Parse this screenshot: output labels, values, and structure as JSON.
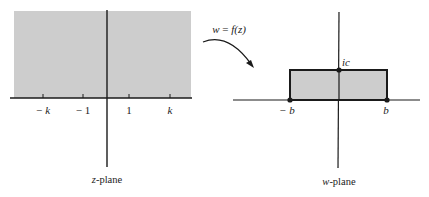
{
  "figure": {
    "colors": {
      "shade": "#cfcfcf",
      "line": "#1a1a1a",
      "background": "#ffffff"
    }
  },
  "z_plane": {
    "caption_var": "z",
    "caption_rest": "-plane",
    "shaded_region": "upper half-plane",
    "ticks": [
      {
        "label_sign": "−",
        "label_var": "k",
        "position": -2
      },
      {
        "label_sign": "−",
        "label_var": "1",
        "position": -1
      },
      {
        "label_sign": "",
        "label_var": "1",
        "position": 1
      },
      {
        "label_sign": "",
        "label_var": "k",
        "position": 2
      }
    ],
    "tick_labels": [
      "− k",
      "− 1",
      "1",
      "k"
    ]
  },
  "mapping": {
    "label_lhs": "w",
    "label_eq": " = ",
    "label_rhs": "f(z)",
    "full_label": "w = f(z)"
  },
  "w_plane": {
    "caption_var": "w",
    "caption_rest": "-plane",
    "shaded_region": "rectangle",
    "points": [
      {
        "label": "− b",
        "name": "minus-b"
      },
      {
        "label": "b",
        "name": "b"
      },
      {
        "label": "ic",
        "name": "ic"
      }
    ],
    "labels": {
      "minus_b": "− b",
      "b": "b",
      "ic": "ic"
    }
  }
}
